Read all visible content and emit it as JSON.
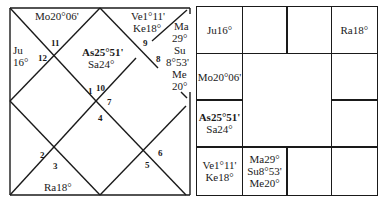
{
  "north_chart": {
    "houses": [
      {
        "num": "1",
        "planets": [
          "As25°51'",
          "Sa24°"
        ]
      },
      {
        "num": "2",
        "planets": []
      },
      {
        "num": "3",
        "planets": [
          "Ra18°"
        ]
      },
      {
        "num": "4",
        "planets": []
      },
      {
        "num": "5",
        "planets": []
      },
      {
        "num": "6",
        "planets": []
      },
      {
        "num": "7",
        "planets": []
      },
      {
        "num": "8",
        "planets": [
          "Ma 29°",
          "Su 8°53'",
          "Me 20°"
        ]
      },
      {
        "num": "9",
        "planets": [
          "Ve1°11'",
          "Ke18°"
        ]
      },
      {
        "num": "10",
        "planets": []
      },
      {
        "num": "11",
        "planets": [
          "Mo20°06'"
        ]
      },
      {
        "num": "12",
        "planets": [
          "Ju 16°"
        ]
      }
    ],
    "labels": {
      "mo": "Mo20°06'",
      "ju1": "Ju",
      "ju2": "16°",
      "as": "As25°51'",
      "sa": "Sa24°",
      "ve": "Ve1°11'",
      "ke": "Ke18°",
      "ma1": "Ma",
      "ma2": "29°",
      "su1": "Su",
      "su2": "8°53'",
      "me1": "Me",
      "me2": "20°",
      "ra": "Ra18°"
    }
  },
  "south_chart": {
    "cells": {
      "r0c0": [
        "Ju16°"
      ],
      "r0c1": [],
      "r0c2": [],
      "r0c3": [
        "Ra18°"
      ],
      "r1c0": [
        "Mo20°06'"
      ],
      "r1c3": [],
      "r2c0": [
        "As25°51'",
        "Sa24°"
      ],
      "r2c3": [],
      "r3c0": [
        "Ve1°11'",
        "Ke18°"
      ],
      "r3c1": [
        "Ma29°",
        "Su8°53'",
        "Me20°"
      ],
      "r3c2": [],
      "r3c3": []
    },
    "text": {
      "ju": "Ju16°",
      "ra": "Ra18°",
      "mo": "Mo20°06'",
      "as": "As25°51'",
      "sa": "Sa24°",
      "ve": "Ve1°11'",
      "ke": "Ke18°",
      "ma": "Ma29°",
      "su": "Su8°53'",
      "me": "Me20°"
    }
  }
}
